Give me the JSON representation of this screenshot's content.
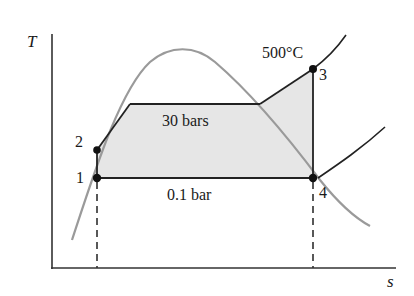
{
  "diagram": {
    "type": "T-s diagram (Rankine cycle)",
    "axes": {
      "y_label": "T",
      "x_label": "s"
    },
    "points": [
      {
        "id": "1",
        "label": "1"
      },
      {
        "id": "2",
        "label": "2"
      },
      {
        "id": "3",
        "label": "3"
      },
      {
        "id": "4",
        "label": "4"
      }
    ],
    "annotations": {
      "high_pressure": "30 bars",
      "low_pressure": "0.1 bar",
      "max_temperature": "500°C"
    },
    "colors": {
      "line": "#222222",
      "dome": "#9a9a9a",
      "fill": "#e6e6e6",
      "background": "#ffffff"
    }
  }
}
